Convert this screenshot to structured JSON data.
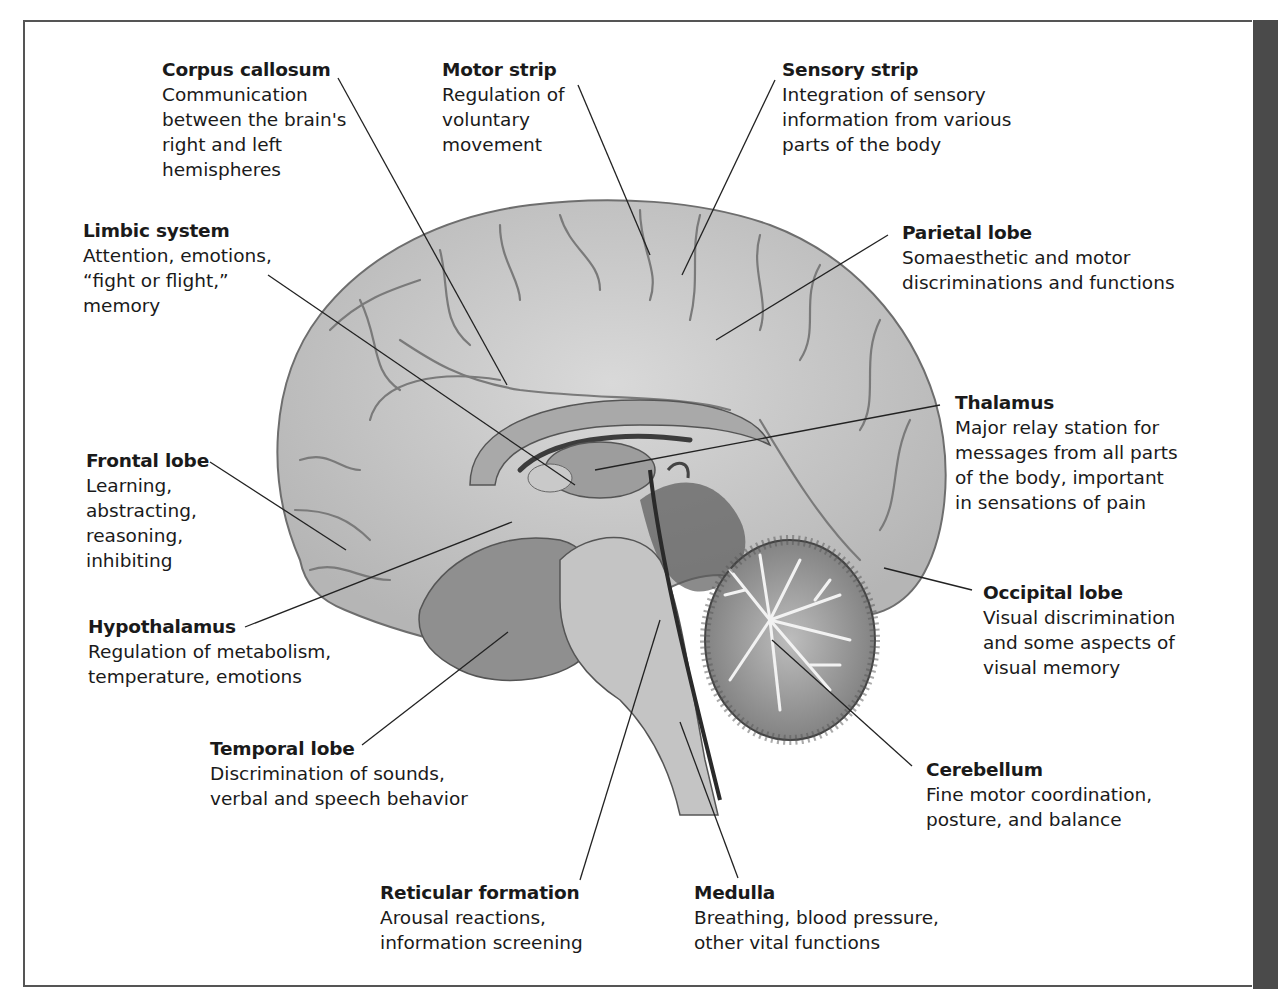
{
  "figure": {
    "type": "labeled-diagram",
    "accent_colors": {
      "frame": "#555555",
      "side_bar": "#4a4a4a",
      "leader_lines": "#222222"
    }
  },
  "labels": {
    "corpus_callosum": {
      "title": "Corpus callosum",
      "lines": [
        "Communication",
        "between the brain's",
        "right and left",
        "hemispheres"
      ]
    },
    "motor_strip": {
      "title": "Motor strip",
      "lines": [
        "Regulation of",
        "voluntary",
        "movement"
      ]
    },
    "sensory_strip": {
      "title": "Sensory strip",
      "lines": [
        "Integration of sensory",
        "information from various",
        "parts of the body"
      ]
    },
    "limbic_system": {
      "title": "Limbic system",
      "lines": [
        "Attention, emotions,",
        "“fight or flight,”",
        "memory"
      ]
    },
    "parietal_lobe": {
      "title": "Parietal lobe",
      "lines": [
        "Somaesthetic and motor",
        "discriminations and functions"
      ]
    },
    "thalamus": {
      "title": "Thalamus",
      "lines": [
        "Major relay station for",
        "messages from all parts",
        "of the body, important",
        "in sensations of pain"
      ]
    },
    "frontal_lobe": {
      "title": "Frontal lobe",
      "lines": [
        "Learning,",
        "abstracting,",
        "reasoning,",
        "inhibiting"
      ]
    },
    "occipital_lobe": {
      "title": "Occipital lobe",
      "lines": [
        "Visual discrimination",
        "and some aspects of",
        "visual memory"
      ]
    },
    "hypothalamus": {
      "title": "Hypothalamus",
      "lines": [
        "Regulation of metabolism,",
        "temperature, emotions"
      ]
    },
    "temporal_lobe": {
      "title": "Temporal lobe",
      "lines": [
        "Discrimination of sounds,",
        "verbal and speech behavior"
      ]
    },
    "cerebellum": {
      "title": "Cerebellum",
      "lines": [
        "Fine motor coordination,",
        "posture, and balance"
      ]
    },
    "reticular_formation": {
      "title": "Reticular formation",
      "lines": [
        "Arousal reactions,",
        "information screening"
      ]
    },
    "medulla": {
      "title": "Medulla",
      "lines": [
        "Breathing, blood pressure,",
        "other vital functions"
      ]
    }
  }
}
